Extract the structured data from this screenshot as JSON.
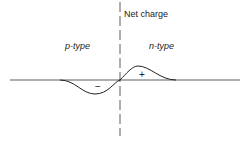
{
  "diagram": {
    "title": "Net charge",
    "left_region": "p-type",
    "right_region": "n-type",
    "negative_sign": "−",
    "positive_sign": "+"
  }
}
